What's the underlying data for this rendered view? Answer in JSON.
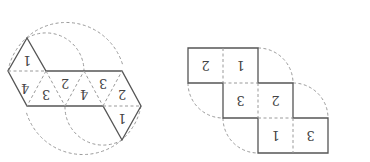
{
  "figure_left": {
    "name": "octahedron-net",
    "orientation": "rotated-180",
    "triangle_labels": {
      "top_triangle": "1",
      "strip": [
        "4",
        "3",
        "2",
        "4",
        "3",
        "2"
      ],
      "bottom_triangle": "1"
    }
  },
  "figure_right": {
    "name": "cube-net-squares",
    "orientation": "rotated-180",
    "rows": [
      [
        "2",
        "1"
      ],
      [
        "3",
        "2"
      ],
      [
        "1",
        "3"
      ]
    ]
  },
  "colors": {
    "solid_line": "#555555",
    "dashed_line": "#9a9a9a",
    "label": "#444444"
  }
}
